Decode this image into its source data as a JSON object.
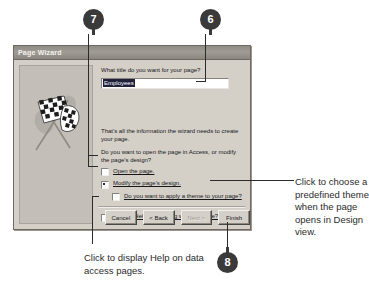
{
  "dialog": {
    "title": "Page Wizard",
    "illustration_icon": "checkered-flags-icon",
    "question_label": "What title do you want for your page?",
    "title_field": {
      "value": "Employees",
      "placeholder": "Employees",
      "selected": true
    },
    "paragraphs": [
      "That's all the information the wizard needs to create your page.",
      "Do you want to open the page in Access, or modify the page's design?"
    ],
    "options": [
      {
        "label": "Open the page.",
        "underline": "O",
        "selected": false
      },
      {
        "label": "Modify the page's design.",
        "underline": "M",
        "selected": true
      }
    ],
    "theme_checkbox": {
      "label": "Do you want to apply a theme to your page?",
      "underline": "a",
      "checked": false
    },
    "help_checkbox": {
      "label": "Display Help on working with the page?",
      "underline": "H",
      "checked": false
    },
    "buttons": [
      {
        "label": "Cancel",
        "disabled": false
      },
      {
        "label": "< Back",
        "disabled": false
      },
      {
        "label": "Next >",
        "disabled": true
      },
      {
        "label": "Finish",
        "disabled": false
      }
    ]
  },
  "callouts": [
    {
      "number": "7",
      "tail": "down"
    },
    {
      "number": "6",
      "tail": "down"
    },
    {
      "number": "8",
      "tail": "up"
    }
  ],
  "annotations": {
    "right": "Click to choose a predefined theme when the page opens in Design view.",
    "bottom": "Click to display Help on data access pages."
  },
  "colors": {
    "dialog_face": "#d4d0c8",
    "titlebar": "#8e8a84",
    "badge": "#3a3a3a",
    "selection": "#20203a",
    "annotation_text": "#2b2b2b"
  }
}
